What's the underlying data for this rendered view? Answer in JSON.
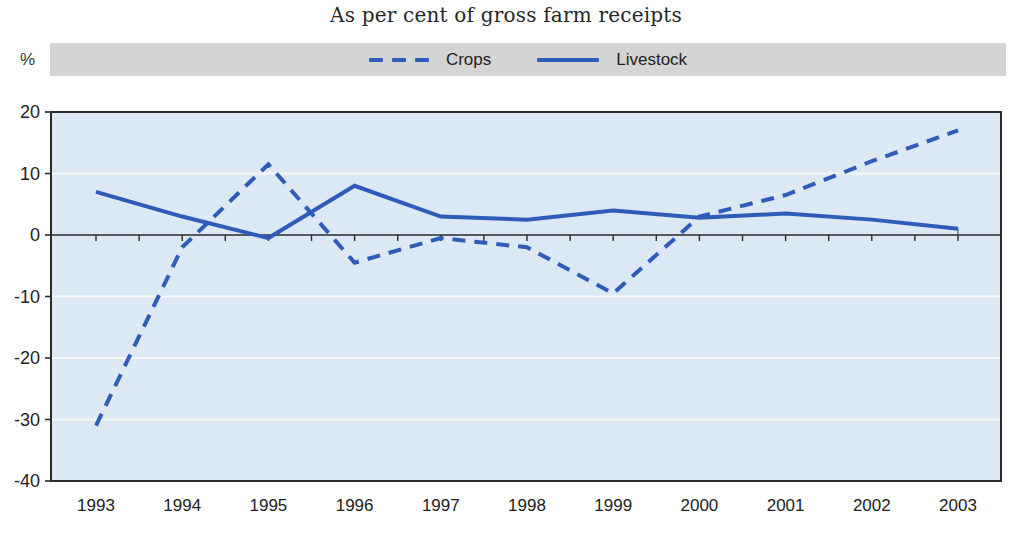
{
  "title": "As per cent of gross farm receipts",
  "y_unit": "%",
  "legend": [
    {
      "label": "Crops",
      "style": "dashed"
    },
    {
      "label": "Livestock",
      "style": "solid"
    }
  ],
  "colors": {
    "line_blue": "#2f5cb8",
    "plot_bg": "#dce8f3",
    "legend_bg": "#d4d4d4",
    "axis": "#2b2b2b",
    "grid": "#f6f9fc",
    "text": "#222222",
    "end_cap": "#5a5a5a"
  },
  "chart_data": {
    "type": "line",
    "x": [
      1993,
      1994,
      1995,
      1996,
      1997,
      1998,
      1999,
      2000,
      2001,
      2002,
      2003
    ],
    "series": [
      {
        "name": "Crops",
        "dash": true,
        "values": [
          -31,
          -2,
          11.5,
          -4.5,
          -0.5,
          -2,
          -9.5,
          3,
          6.5,
          12,
          17
        ]
      },
      {
        "name": "Livestock",
        "dash": false,
        "values": [
          7,
          3,
          -0.5,
          8,
          3,
          2.5,
          4,
          2.8,
          3.5,
          2.5,
          1
        ]
      }
    ],
    "title": "As per cent of gross farm receipts",
    "xlabel": "",
    "ylabel": "%",
    "ylim": [
      -40,
      20
    ],
    "y_ticks": [
      20,
      10,
      0,
      -10,
      -20,
      -30,
      -40
    ],
    "x_minor_ticks_per_year": 2,
    "grid": true,
    "legend_position": "top"
  }
}
